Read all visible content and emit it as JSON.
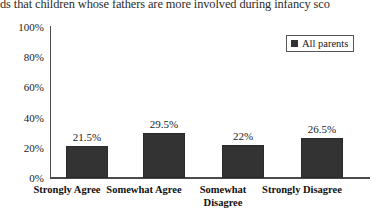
{
  "page": {
    "body_text_fragment": "ds that children whose fathers are more involved during infancy sco"
  },
  "legend": {
    "position": "top-right",
    "entries": [
      {
        "label": "All parents",
        "icon": "legend-square-swatch",
        "color": "#333333"
      }
    ]
  },
  "chart_data": {
    "type": "bar",
    "title": "",
    "xlabel": "",
    "ylabel": "",
    "categories": [
      "Strongly Agree",
      "Somewhat Agree",
      "Somewhat Disagree",
      "Strongly Disagree"
    ],
    "series": [
      {
        "name": "All parents",
        "values": [
          21.5,
          29.5,
          22,
          26.5
        ],
        "value_labels": [
          "21.5%",
          "29.5%",
          "22%",
          "26.5%"
        ],
        "color": "#333333"
      }
    ],
    "ylim": [
      0,
      100
    ],
    "ytick_values": [
      0,
      20,
      40,
      60,
      80,
      100
    ],
    "ytick_labels": [
      "0%",
      "20%",
      "40%",
      "60%",
      "80%",
      "100%"
    ],
    "grid": false,
    "legend_position": "top-right"
  }
}
